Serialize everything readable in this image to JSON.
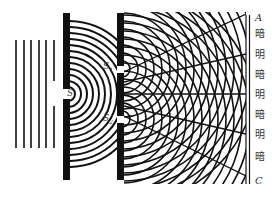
{
  "diagram": {
    "source_slit": {
      "label": "S",
      "x": 70,
      "y": 94
    },
    "double_slits": [
      {
        "label": "S",
        "subscript": "1",
        "x": 120,
        "y": 69
      },
      {
        "label": "S",
        "subscript": "2",
        "x": 120,
        "y": 119
      }
    ],
    "plane_waves": {
      "count": 6,
      "x": [
        16,
        24,
        31,
        39,
        46,
        54
      ]
    },
    "screen": {
      "top_label": "A",
      "bottom_label": "C",
      "fringes": [
        {
          "label": "暗",
          "y": 34
        },
        {
          "label": "明",
          "y": 55
        },
        {
          "label": "暗",
          "y": 75
        },
        {
          "label": "明",
          "y": 95
        },
        {
          "label": "暗",
          "y": 115
        },
        {
          "label": "明",
          "y": 135
        },
        {
          "label": "暗",
          "y": 157
        }
      ]
    },
    "colors": {
      "ink": "#111111",
      "label": "#333333",
      "background": "#ffffff"
    }
  }
}
